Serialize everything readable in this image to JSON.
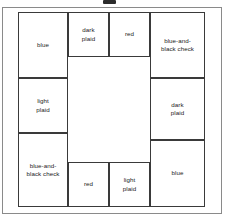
{
  "figure": {
    "type": "grid-diagram",
    "border_color": "#3a3a3a",
    "frame_color": "#8a8a8a",
    "background_color": "#ffffff",
    "text_color": "#1a1a1a"
  },
  "cells": [
    {
      "id": "top-left-blue",
      "label": "blue",
      "position": "top-left",
      "x": 0,
      "y": 0,
      "w": 50,
      "h": 66
    },
    {
      "id": "top-dark-plaid",
      "label": "dark\nplaid",
      "position": "top-second",
      "x": 50,
      "y": 0,
      "w": 41,
      "h": 45
    },
    {
      "id": "top-red",
      "label": "red",
      "position": "top-third",
      "x": 91,
      "y": 0,
      "w": 41,
      "h": 45
    },
    {
      "id": "top-right-check",
      "label": "blue-and-\nblack check",
      "position": "top-right",
      "x": 132,
      "y": 0,
      "w": 55,
      "h": 66
    },
    {
      "id": "left-light-plaid",
      "label": "light\nplaid",
      "position": "left-middle",
      "x": 0,
      "y": 66,
      "w": 50,
      "h": 55
    },
    {
      "id": "right-dark-plaid",
      "label": "dark\nplaid",
      "position": "right-middle",
      "x": 132,
      "y": 66,
      "w": 55,
      "h": 62
    },
    {
      "id": "bottom-left-check",
      "label": "blue-and-\nblack check",
      "position": "bottom-left",
      "x": 0,
      "y": 121,
      "w": 50,
      "h": 74
    },
    {
      "id": "right-blue",
      "label": "blue",
      "position": "right-bottom",
      "x": 132,
      "y": 128,
      "w": 55,
      "h": 67
    },
    {
      "id": "bottom-red",
      "label": "red",
      "position": "bottom-second",
      "x": 50,
      "y": 150,
      "w": 41,
      "h": 45
    },
    {
      "id": "bottom-light-plaid",
      "label": "light\nplaid",
      "position": "bottom-third",
      "x": 91,
      "y": 150,
      "w": 41,
      "h": 45
    }
  ],
  "center": {
    "id": "center-void",
    "label": "",
    "x": 50,
    "y": 45,
    "w": 82,
    "h": 105
  },
  "legend": {
    "swatch_names": [
      "blue",
      "dark plaid",
      "red",
      "blue-and-black check",
      "light plaid"
    ]
  }
}
